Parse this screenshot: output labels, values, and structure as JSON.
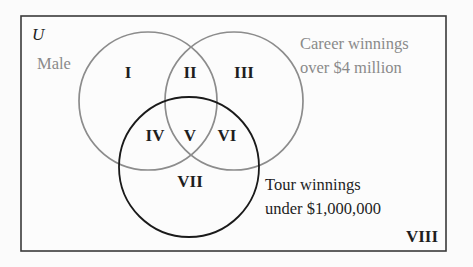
{
  "diagram": {
    "type": "venn-3-set",
    "universe": {
      "label": "U",
      "rect": {
        "x": 21,
        "y": 16,
        "width": 425,
        "height": 235
      }
    },
    "sets": [
      {
        "id": "male",
        "label_lines": [
          "Male"
        ],
        "color": "#8c8c8c",
        "circle": {
          "cx": 148,
          "cy": 101,
          "r": 69
        }
      },
      {
        "id": "career",
        "label_lines": [
          "Career winnings",
          "over $4 million"
        ],
        "color": "#8c8c8c",
        "circle": {
          "cx": 234,
          "cy": 101,
          "r": 69
        }
      },
      {
        "id": "tour",
        "label_lines": [
          "Tour winnings",
          "under $1,000,000"
        ],
        "color": "#1a1a1a",
        "circle": {
          "cx": 189,
          "cy": 167,
          "r": 70
        }
      }
    ],
    "regions": [
      {
        "label": "I",
        "x": 128,
        "y": 74
      },
      {
        "label": "II",
        "x": 190,
        "y": 74
      },
      {
        "label": "III",
        "x": 244,
        "y": 74
      },
      {
        "label": "IV",
        "x": 155,
        "y": 137
      },
      {
        "label": "V",
        "x": 190,
        "y": 137
      },
      {
        "label": "VI",
        "x": 227,
        "y": 137
      },
      {
        "label": "VII",
        "x": 190,
        "y": 183
      },
      {
        "label": "VIII",
        "x": 422,
        "y": 238
      }
    ]
  },
  "colors": {
    "background": "#fbfbfb",
    "frame": "#3a3a3a",
    "gray_set": "#8c8c8c",
    "black_set": "#1a1a1a",
    "text_dark": "#1e1e1e",
    "text_gray": "#8a8a8a"
  }
}
